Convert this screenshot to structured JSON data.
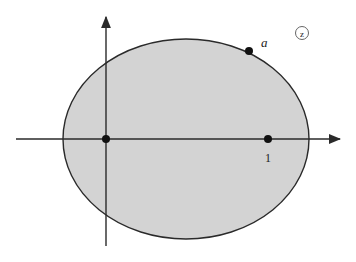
{
  "diagram": {
    "plane_label": "z",
    "point_a_label": "a",
    "point_one_label": "1",
    "colors": {
      "region_fill": "#d3d3d3",
      "stroke": "#2a2a2a",
      "background": "#ffffff"
    },
    "region": {
      "shape": "ellipse",
      "cx": 186,
      "cy": 139,
      "rx": 123,
      "ry": 100
    },
    "axes": {
      "x": {
        "x1": 16,
        "x2": 342,
        "y": 139
      },
      "y": {
        "x": 106,
        "y1": 246,
        "y2": 15
      }
    },
    "points": [
      {
        "name": "origin",
        "x": 106,
        "y": 139
      },
      {
        "name": "one",
        "x": 268,
        "y": 139
      },
      {
        "name": "a",
        "x": 249,
        "y": 51
      }
    ]
  }
}
